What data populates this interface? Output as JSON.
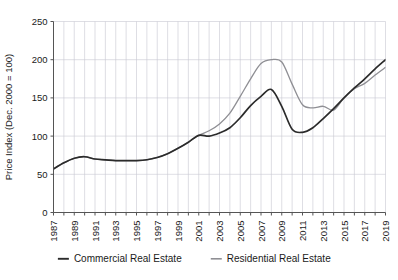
{
  "chart_data": {
    "type": "line",
    "title": "",
    "subtitle": "",
    "xlabel": "",
    "ylabel": "Price Index (Dec. 2000 = 100)",
    "ylim": [
      0,
      250
    ],
    "xlim": [
      1987,
      2019
    ],
    "y_ticks": [
      0,
      50,
      100,
      150,
      200,
      250
    ],
    "x_ticks": [
      1987,
      1989,
      1991,
      1993,
      1995,
      1997,
      1999,
      2001,
      2003,
      2005,
      2007,
      2009,
      2011,
      2013,
      2015,
      2017,
      2019
    ],
    "x_minor_ticks": [
      1988,
      1990,
      1992,
      1994,
      1996,
      1998,
      2000,
      2002,
      2004,
      2006,
      2008,
      2010,
      2012,
      2014,
      2016,
      2018
    ],
    "grid": true,
    "grid_color": "#c8c8d2",
    "legend_position": "bottom",
    "x": [
      1987,
      1988,
      1989,
      1990,
      1991,
      1992,
      1993,
      1994,
      1995,
      1996,
      1997,
      1998,
      1999,
      2000,
      2001,
      2002,
      2003,
      2004,
      2005,
      2006,
      2007,
      2008,
      2009,
      2010,
      2011,
      2012,
      2013,
      2014,
      2015,
      2016,
      2017,
      2018,
      2019
    ],
    "series": [
      {
        "name": "Commercial Real Estate",
        "color": "#2b2b2b",
        "values": [
          57,
          65,
          71,
          73,
          70,
          69,
          68,
          68,
          68,
          69,
          72,
          77,
          84,
          92,
          101,
          100,
          104,
          111,
          124,
          140,
          152,
          161,
          139,
          109,
          105,
          111,
          123,
          136,
          150,
          163,
          175,
          188,
          200
        ]
      },
      {
        "name": "Residential Real Estate",
        "color": "#8f8f94",
        "values": [
          57,
          65,
          71,
          73,
          70,
          69,
          68,
          68,
          68,
          69,
          72,
          77,
          84,
          92,
          101,
          107,
          116,
          130,
          152,
          175,
          195,
          200,
          197,
          168,
          141,
          137,
          139,
          134,
          150,
          162,
          169,
          180,
          190
        ]
      }
    ]
  },
  "legend": {
    "items": [
      {
        "label": "Commercial Real Estate",
        "color": "#2b2b2b"
      },
      {
        "label": "Residential Real Estate",
        "color": "#8f8f94"
      }
    ]
  }
}
